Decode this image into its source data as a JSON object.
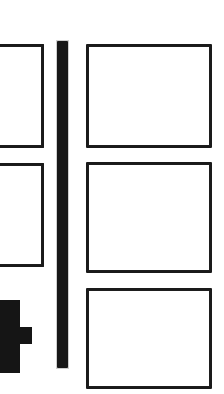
{
  "page": {
    "title": "Panel Layout Diagram",
    "background_color": "#ffffff",
    "ink_color": "#1a1a1a",
    "width": 224,
    "height": 394,
    "style": "scanned black-and-white line art"
  },
  "left_column": {
    "label": "Left panel column (clipped by page edge)",
    "panels": [
      {
        "name": "left-panel-1",
        "label": "",
        "x": -10,
        "y": 44,
        "width": 54,
        "height": 104,
        "clipped": "left"
      },
      {
        "name": "left-panel-2",
        "label": "",
        "x": -10,
        "y": 163,
        "width": 54,
        "height": 104,
        "clipped": "left"
      }
    ]
  },
  "divider": {
    "name": "vertical-divider-bar",
    "label": "",
    "x": 57,
    "y": 41,
    "width": 11,
    "height": 327,
    "color": "#151515"
  },
  "cross_mark": {
    "name": "plus-cross-mark",
    "label": "",
    "color": "#151515",
    "stem": {
      "x": -8,
      "y": 300,
      "width": 28,
      "height": 73
    },
    "arm": {
      "x": -8,
      "y": 327,
      "width": 40,
      "height": 17
    }
  },
  "right_column": {
    "label": "Right panel column",
    "panels": [
      {
        "name": "right-panel-1",
        "label": "",
        "x": 86,
        "y": 44,
        "width": 126,
        "height": 104
      },
      {
        "name": "right-panel-2",
        "label": "",
        "x": 86,
        "y": 162,
        "width": 126,
        "height": 111
      },
      {
        "name": "right-panel-3",
        "label": "",
        "x": 86,
        "y": 288,
        "width": 126,
        "height": 101
      }
    ]
  }
}
